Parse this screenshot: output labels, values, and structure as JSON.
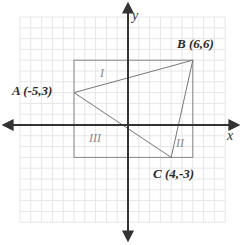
{
  "axes": {
    "x_label": "x",
    "y_label": "y",
    "origin_px": [
      128,
      125
    ],
    "unit_px": 10.8
  },
  "grid": {
    "x_min": -10,
    "x_max": 9,
    "y_min": -9,
    "y_max": 10,
    "color": "#e6e6e6"
  },
  "points": [
    {
      "name": "A",
      "label": "A (-5,3)",
      "x": -5,
      "y": 3
    },
    {
      "name": "B",
      "label": "B (6,6)",
      "x": 6,
      "y": 6
    },
    {
      "name": "C",
      "label": "C (4,-3)",
      "x": 4,
      "y": -3
    }
  ],
  "bounding_rectangle": {
    "x_min": -5,
    "x_max": 6,
    "y_min": -3,
    "y_max": 6,
    "color": "#888888"
  },
  "regions": [
    {
      "label": "I"
    },
    {
      "label": "II"
    },
    {
      "label": "III"
    }
  ],
  "colors": {
    "axis": "#333333",
    "triangle": "#777777",
    "rectangle": "#888888",
    "text": "#2a2a2a"
  }
}
